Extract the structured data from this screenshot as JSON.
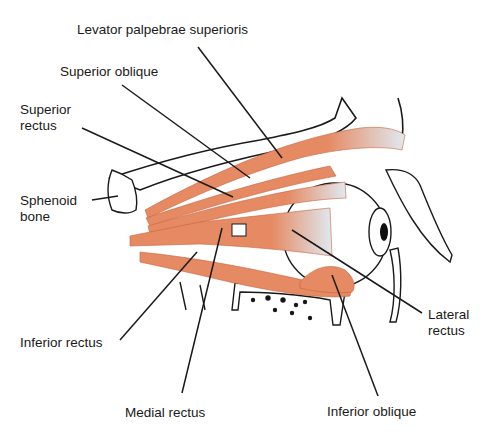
{
  "figure": {
    "colors": {
      "muscle": "#e58a62",
      "muscle_dark": "#c9633c",
      "tendon": "#dfe9f1",
      "outline": "#1a1a1a",
      "background": "#ffffff"
    }
  },
  "labels": {
    "levator": "Levator palpebrae superioris",
    "superior_oblique": "Superior oblique",
    "superior_rectus_1": "Superior",
    "superior_rectus_2": "rectus",
    "sphenoid_1": "Sphenoid",
    "sphenoid_2": "bone",
    "inferior_rectus": "Inferior rectus",
    "medial_rectus": "Medial rectus",
    "inferior_oblique": "Inferior oblique",
    "lateral_rectus_1": "Lateral",
    "lateral_rectus_2": "rectus"
  }
}
